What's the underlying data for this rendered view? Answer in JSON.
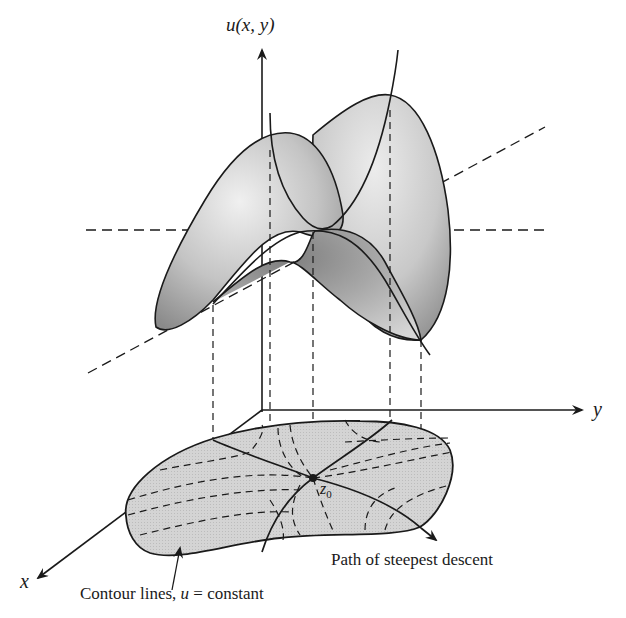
{
  "figure": {
    "axes": {
      "vertical": {
        "label_func": "u",
        "label_args": "(x, y)"
      },
      "y_axis": {
        "label": "y"
      },
      "x_axis": {
        "label": "x"
      }
    },
    "saddle_point": {
      "label_main": "z",
      "label_sub": "0"
    },
    "annotations": {
      "contour": {
        "text_prefix": "Contour lines, ",
        "var": "u",
        "text_suffix": " = constant"
      },
      "path": {
        "text": "Path of steepest descent"
      }
    },
    "colors": {
      "line": "#1a1a1a",
      "surface_light": "#e6e6e6",
      "surface_mid": "#b4b4b4",
      "surface_dark": "#7a7a7a",
      "base_fill": "#d2d2d2",
      "background": "#ffffff"
    }
  }
}
